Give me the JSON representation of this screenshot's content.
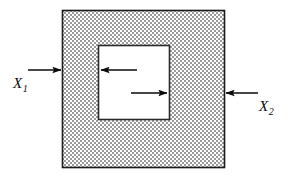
{
  "figure": {
    "type": "force-diagram",
    "outer_square": {
      "name": "outer-square",
      "fill_pattern": "gray-stipple",
      "fill_color": "#b8b8b8",
      "border_color": "#1a1a1a",
      "x": 62,
      "y": 10,
      "width": 163,
      "height": 158
    },
    "inner_square": {
      "name": "inner-square-cavity",
      "fill_color": "#ffffff",
      "border_color": "#2a2a2a",
      "x": 98,
      "y": 45,
      "width": 72,
      "height": 75
    },
    "arrows": [
      {
        "name": "arrow-x1-external",
        "direction": "right",
        "x1": 28,
        "y1": 70,
        "x2": 62,
        "y2": 70,
        "color": "#0a0a0a"
      },
      {
        "name": "arrow-internal-left",
        "direction": "left",
        "x1": 137,
        "y1": 70,
        "x2": 100,
        "y2": 70,
        "color": "#0a0a0a"
      },
      {
        "name": "arrow-internal-right",
        "direction": "right",
        "x1": 131,
        "y1": 93,
        "x2": 168,
        "y2": 93,
        "color": "#0a0a0a"
      },
      {
        "name": "arrow-x2-external",
        "direction": "left",
        "x1": 258,
        "y1": 93,
        "x2": 224,
        "y2": 93,
        "color": "#0a0a0a"
      }
    ],
    "labels": {
      "x1": {
        "base": "X",
        "subscript": "1"
      },
      "x2": {
        "base": "X",
        "subscript": "2"
      }
    }
  }
}
